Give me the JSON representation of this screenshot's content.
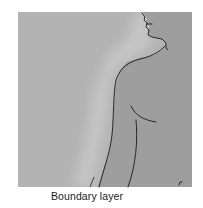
{
  "diagram": {
    "title": "",
    "label": "Boundary layer",
    "colors": {
      "ambient": "#b3b3b3",
      "halo": "#c4c4c4",
      "body": "#9d9d9d",
      "outline": "#1a1a1a",
      "page": "#ffffff"
    },
    "elements": [
      {
        "type": "panel",
        "name": "air-background"
      },
      {
        "type": "silhouette",
        "name": "human-torso-profile"
      },
      {
        "type": "gradient",
        "name": "boundary-layer-halo"
      },
      {
        "type": "leader-line",
        "name": "boundary-layer-pointer"
      },
      {
        "type": "text",
        "name": "boundary-layer-label",
        "text": "Boundary layer"
      }
    ]
  }
}
